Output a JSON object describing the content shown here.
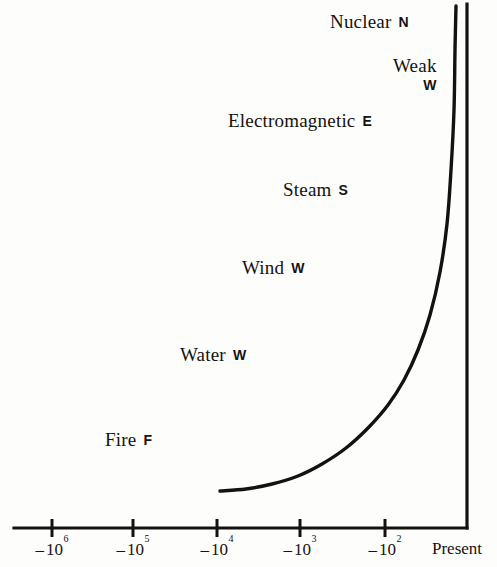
{
  "chart_data": {
    "type": "line",
    "title": "",
    "subtitle": "",
    "xlabel": "",
    "ylabel": "",
    "grid": false,
    "legend_position": "none",
    "x_axis": {
      "type": "log-negative-years",
      "tick_labels": [
        "-10⁶",
        "-10⁵",
        "-10⁴",
        "-10³",
        "-10²",
        "Present"
      ],
      "ticks": [
        {
          "base": "10",
          "sign": "–",
          "exponent": "6",
          "x_px": 52
        },
        {
          "base": "10",
          "sign": "–",
          "exponent": "5",
          "x_px": 133
        },
        {
          "base": "10",
          "sign": "–",
          "exponent": "4",
          "x_px": 217
        },
        {
          "base": "10",
          "sign": "–",
          "exponent": "3",
          "x_px": 300
        },
        {
          "base": "10",
          "sign": "–",
          "exponent": "2",
          "x_px": 385
        }
      ],
      "end_label": "Present",
      "end_label_x_px": 432
    },
    "y_axis": {
      "type": "implicit-power",
      "tick_labels": [],
      "axis_line_x_px": 467
    },
    "annotations": [
      {
        "label": "Nuclear",
        "symbol": "N",
        "x_px": 330,
        "y_px": 12,
        "layout": "inline"
      },
      {
        "label": "Weak",
        "symbol": "W",
        "x_px": 393,
        "y_px": 56,
        "layout": "stacked"
      },
      {
        "label": "Electromagnetic",
        "symbol": "E",
        "x_px": 228,
        "y_px": 111,
        "layout": "inline"
      },
      {
        "label": "Steam",
        "symbol": "S",
        "x_px": 283,
        "y_px": 180,
        "layout": "inline"
      },
      {
        "label": "Wind",
        "symbol": "W",
        "x_px": 242,
        "y_px": 258,
        "layout": "inline"
      },
      {
        "label": "Water",
        "symbol": "W",
        "x_px": 180,
        "y_px": 345,
        "layout": "inline"
      },
      {
        "label": "Fire",
        "symbol": "F",
        "x_px": 105,
        "y_px": 430,
        "layout": "inline"
      }
    ],
    "curve_points": [
      {
        "x": 220,
        "y": 491
      },
      {
        "x": 246,
        "y": 489
      },
      {
        "x": 272,
        "y": 484
      },
      {
        "x": 298,
        "y": 476
      },
      {
        "x": 322,
        "y": 464
      },
      {
        "x": 346,
        "y": 448
      },
      {
        "x": 368,
        "y": 428
      },
      {
        "x": 388,
        "y": 405
      },
      {
        "x": 404,
        "y": 380
      },
      {
        "x": 418,
        "y": 350
      },
      {
        "x": 430,
        "y": 315
      },
      {
        "x": 440,
        "y": 272
      },
      {
        "x": 447,
        "y": 224
      },
      {
        "x": 451,
        "y": 170
      },
      {
        "x": 454,
        "y": 110
      },
      {
        "x": 455,
        "y": 50
      },
      {
        "x": 456,
        "y": 6
      }
    ],
    "colors": {
      "ink": "#15120f",
      "background": "#fdfdfb",
      "curve": "#141210",
      "axis": "#141210"
    }
  },
  "figure": {
    "curve_name": "energy-growth-curve",
    "axis_name": "time-power-axes"
  }
}
